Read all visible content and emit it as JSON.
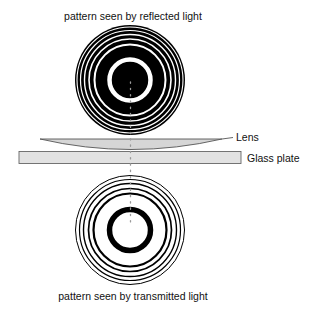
{
  "diagram": {
    "title_top": "pattern seen by reflected light",
    "title_bottom": "pattern seen by transmitted light",
    "labels": {
      "lens": "Lens",
      "glass_plate": "Glass plate"
    },
    "colors": {
      "ink": "#000000",
      "paper": "#ffffff",
      "lens_fill": "#d6d6d6",
      "plate_fill": "#e2e2e2",
      "outline": "#555555",
      "axis_dots": "#9a9a9a"
    },
    "reflected_pattern": {
      "center": [
        130,
        80
      ],
      "outer_radius": 55,
      "rings_note": "dark center disk with alternating bright rings that become thinner toward the edge"
    },
    "transmitted_pattern": {
      "center": [
        130,
        230
      ],
      "outer_radius": 55,
      "rings_note": "bright center with alternating dark rings that become thinner toward the edge"
    }
  }
}
